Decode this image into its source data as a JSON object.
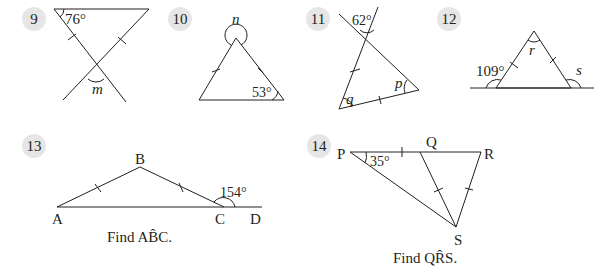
{
  "problems": [
    {
      "number": "9",
      "angle_given": "76°",
      "unknown": "m"
    },
    {
      "number": "10",
      "angle_given": "53°",
      "unknown": "n"
    },
    {
      "number": "11",
      "angle_given": "62°",
      "unknowns": [
        "p",
        "q"
      ]
    },
    {
      "number": "12",
      "angle_given": "109°",
      "unknowns": [
        "r",
        "s"
      ]
    },
    {
      "number": "13",
      "angle_given": "154°",
      "vertices": [
        "A",
        "B",
        "C",
        "D"
      ],
      "caption": "Find AB̂C."
    },
    {
      "number": "14",
      "angle_given": "35°",
      "vertices": [
        "P",
        "Q",
        "R",
        "S"
      ],
      "caption": "Find QR̂S."
    }
  ]
}
